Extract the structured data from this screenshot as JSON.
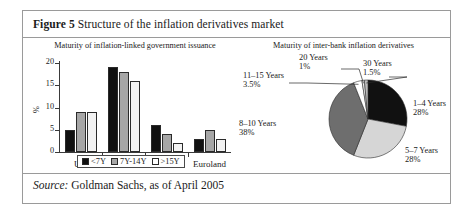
{
  "figure": {
    "number_label": "Figure 5",
    "caption": "Structure of the inflation derivatives market",
    "source_label": "Source:",
    "source_text": "Goldman Sachs, as of April 2005"
  },
  "colors": {
    "series_lt7y": "#111111",
    "series_7y14y": "#a6a6a6",
    "series_gt15y": "#f2f2f2",
    "pie_black": "#111111",
    "pie_light_gray": "#d6d6d6",
    "pie_dark_gray": "#6e6e6e",
    "pie_white": "#ffffff",
    "border": "#9a9a9a",
    "axis": "#3a3a3a"
  },
  "chart_data": [
    {
      "type": "bar",
      "title": "Maturity of inflation-linked government issuance",
      "xlabel": "",
      "ylabel": "%",
      "ylim": [
        0,
        20
      ],
      "yticks": [
        0,
        5,
        10,
        15,
        20
      ],
      "ytick_labels": [
        "0",
        "5",
        "10",
        "15",
        "20"
      ],
      "grid": false,
      "legend_position": "bottom",
      "categories": [
        "UK",
        "US",
        "France",
        "Euroland"
      ],
      "series": [
        {
          "name": "<7Y",
          "values": [
            5,
            19,
            6,
            3
          ]
        },
        {
          "name": "7Y-14Y",
          "values": [
            9,
            18,
            4,
            5
          ]
        },
        {
          "name": ">15Y",
          "values": [
            9,
            16,
            2,
            3
          ]
        }
      ]
    },
    {
      "type": "pie",
      "title": "Maturity of inter-bank inflation derivatives",
      "labels": [
        "1–4 Years",
        "5–7 Years",
        "8–10 Years",
        "11–15 Years",
        "20 Years",
        "30 Years"
      ],
      "values": [
        28,
        28,
        38,
        3.5,
        1,
        1.5
      ],
      "value_labels": [
        "28%",
        "28%",
        "38%",
        "3.5%",
        "1%",
        "1.5%"
      ],
      "slice_colors": [
        "#111111",
        "#d6d6d6",
        "#6e6e6e",
        "#ffffff",
        "#f6f6f6",
        "#bdbdbd"
      ],
      "legend_position": "none"
    }
  ]
}
